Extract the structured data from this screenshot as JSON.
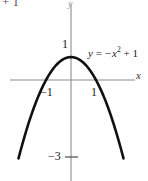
{
  "figure": {
    "background_color": "#ffffff",
    "clipped_text_above": "+ 1"
  },
  "axes": {
    "y_axis_name": "y",
    "x_axis_name": "x",
    "axis_color": "#8c8c8c"
  },
  "ticks": {
    "y_one": "1",
    "x_negative_one": "−1",
    "x_one": "1",
    "y_negative_three": "−3"
  },
  "annotation": {
    "equation_lhs": "y",
    "equation_eq": "=",
    "equation_rhs_base": "−x",
    "equation_exponent": "2",
    "equation_tail": "+ 1",
    "equation_full": "y = −x² + 1"
  },
  "chart_data": {
    "type": "line",
    "title": "",
    "subtitle": "",
    "xlabel": "x",
    "ylabel": "y",
    "equation": "y = -x^2 + 1",
    "curve_color": "#111111",
    "curve_width": 2.6,
    "grid": false,
    "legend": "none",
    "annotations": [
      {
        "text": "y = −x² + 1",
        "x": 1.05,
        "y": 0.95
      }
    ],
    "xlim": [
      -2.5,
      2.7
    ],
    "ylim": [
      -4.6,
      1.9
    ],
    "xticks": [
      -1,
      1
    ],
    "xticklabels": [
      "−1",
      "1"
    ],
    "yticks": [
      1,
      -3
    ],
    "yticklabels": [
      "1",
      "−3"
    ],
    "roots": [
      -1,
      1
    ],
    "vertex": [
      0,
      1
    ],
    "series": [
      {
        "name": "y = -x^2 + 1",
        "x": [
          -2.1,
          -2.0,
          -1.9,
          -1.8,
          -1.7,
          -1.6,
          -1.5,
          -1.4,
          -1.3,
          -1.2,
          -1.1,
          -1.0,
          -0.9,
          -0.8,
          -0.7,
          -0.6,
          -0.5,
          -0.4,
          -0.3,
          -0.2,
          -0.1,
          0.0,
          0.1,
          0.2,
          0.3,
          0.4,
          0.5,
          0.6,
          0.7,
          0.8,
          0.9,
          1.0,
          1.1,
          1.2,
          1.3,
          1.4,
          1.5,
          1.6,
          1.7,
          1.8,
          1.9,
          2.0,
          2.1
        ],
        "y": [
          -3.41,
          -3.0,
          -2.61,
          -2.24,
          -1.89,
          -1.56,
          -1.25,
          -0.96,
          -0.69,
          -0.44,
          -0.21,
          0.0,
          0.19,
          0.36,
          0.51,
          0.64,
          0.75,
          0.84,
          0.91,
          0.96,
          0.99,
          1.0,
          0.99,
          0.96,
          0.91,
          0.84,
          0.75,
          0.64,
          0.51,
          0.36,
          0.19,
          0.0,
          -0.21,
          -0.44,
          -0.69,
          -0.96,
          -1.25,
          -1.56,
          -1.89,
          -2.24,
          -2.61,
          -3.0,
          -3.41
        ]
      }
    ]
  }
}
